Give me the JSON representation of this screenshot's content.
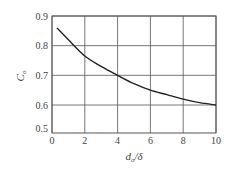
{
  "chart_data": {
    "type": "line",
    "title": "",
    "xlabel": "d_o/δ",
    "xlabel_main": "d",
    "xlabel_sub": "o",
    "xlabel_rest": "/δ",
    "ylabel": "C_o",
    "ylabel_main": "C",
    "ylabel_sub": "o",
    "xlim": [
      0,
      10
    ],
    "ylim": [
      0.5,
      0.9
    ],
    "grid": true,
    "legend": null,
    "x_ticks": [
      "0",
      "2",
      "4",
      "6",
      "8",
      "10"
    ],
    "y_ticks": [
      "0.9",
      "0.8",
      "0.7",
      "0.6",
      "0.5"
    ],
    "series": [
      {
        "name": "C_o",
        "x": [
          0.3,
          1,
          2,
          3,
          4,
          5,
          6,
          7,
          8,
          9,
          10
        ],
        "y": [
          0.86,
          0.82,
          0.765,
          0.73,
          0.7,
          0.672,
          0.65,
          0.635,
          0.62,
          0.608,
          0.6
        ]
      }
    ]
  },
  "colors": {
    "grid": "#555555",
    "curve": "#222222",
    "text": "#444444"
  }
}
